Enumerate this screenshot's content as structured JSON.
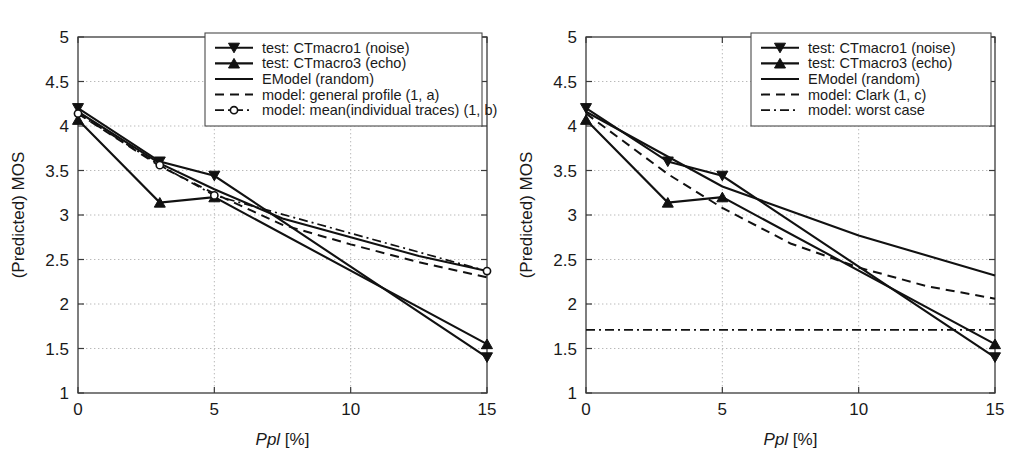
{
  "figure": {
    "panels": [
      {
        "id": "panel-a",
        "subcaption": "(a)",
        "xlabel_italic": "Ppl",
        "xlabel_rest": " [%]",
        "ylabel": "(Predicted) MOS"
      },
      {
        "id": "panel-b",
        "subcaption": "(b)",
        "xlabel_italic": "Ppl",
        "xlabel_rest": " [%]",
        "ylabel": "(Predicted) MOS"
      }
    ]
  },
  "axis": {
    "x_ticks": [
      "0",
      "5",
      "10",
      "15"
    ],
    "x_tick_values": [
      0,
      5,
      10,
      15
    ],
    "y_ticks": [
      "1",
      "1.5",
      "2",
      "2.5",
      "3",
      "3.5",
      "4",
      "4.5",
      "5"
    ],
    "y_tick_values": [
      1,
      1.5,
      2,
      2.5,
      3,
      3.5,
      4,
      4.5,
      5
    ],
    "xlim": [
      0,
      15
    ],
    "ylim": [
      1,
      5
    ],
    "grid": true,
    "grid_style": "dotted"
  },
  "colors": {
    "line": "#111111",
    "axis": "#3a3a3a",
    "grid": "#b9b9b9",
    "background": "#ffffff"
  },
  "legend_a": {
    "position": "top-center-right",
    "entries": [
      {
        "label": "test: CTmacro1 (noise)",
        "style": "solid",
        "marker": "triangle-down"
      },
      {
        "label": "test: CTmacro3 (echo)",
        "style": "solid",
        "marker": "triangle-up"
      },
      {
        "label": "EModel (random)",
        "style": "solid",
        "marker": "none"
      },
      {
        "label": "model: general profile (1, a)",
        "style": "dashed",
        "marker": "none"
      },
      {
        "label": "model: mean(individual traces) (1, b)",
        "style": "dashdot",
        "marker": "circle-open"
      }
    ]
  },
  "legend_b": {
    "position": "top-right",
    "entries": [
      {
        "label": "test: CTmacro1 (noise)",
        "style": "solid",
        "marker": "triangle-down"
      },
      {
        "label": "test: CTmacro3 (echo)",
        "style": "solid",
        "marker": "triangle-up"
      },
      {
        "label": "EModel (random)",
        "style": "solid",
        "marker": "none"
      },
      {
        "label": "model: Clark (1, c)",
        "style": "dashed",
        "marker": "none"
      },
      {
        "label": "model: worst case",
        "style": "dashdot",
        "marker": "none"
      }
    ]
  },
  "chart_data": [
    {
      "type": "line",
      "title": "(a)",
      "xlabel": "Ppl [%]",
      "ylabel": "(Predicted) MOS",
      "xlim": [
        0,
        15
      ],
      "ylim": [
        1,
        5
      ],
      "grid": true,
      "legend_position": "top-center",
      "series": [
        {
          "name": "test: CTmacro1 (noise)",
          "style": "solid",
          "marker": "triangle-down",
          "x": [
            0,
            3,
            5,
            15
          ],
          "values": [
            4.2,
            3.6,
            3.44,
            1.4
          ]
        },
        {
          "name": "test: CTmacro3 (echo)",
          "style": "solid",
          "marker": "triangle-up",
          "x": [
            0,
            3,
            5,
            15
          ],
          "values": [
            4.07,
            3.14,
            3.2,
            1.55
          ]
        },
        {
          "name": "EModel (random)",
          "style": "solid",
          "marker": "none",
          "x": [
            0,
            3,
            5,
            7.5,
            10,
            12.5,
            15
          ],
          "values": [
            4.16,
            3.58,
            3.29,
            2.96,
            2.75,
            2.54,
            2.37
          ]
        },
        {
          "name": "model: general profile (1, a)",
          "style": "dashed",
          "marker": "none",
          "x": [
            0,
            3,
            5,
            7.5,
            10,
            12.5,
            15
          ],
          "values": [
            4.14,
            3.55,
            3.24,
            2.89,
            2.67,
            2.47,
            2.3
          ]
        },
        {
          "name": "model: mean(individual traces) (1, b)",
          "style": "dashdot",
          "marker": "circle-open",
          "x": [
            0,
            3,
            5,
            15
          ],
          "values": [
            4.14,
            3.56,
            3.22,
            2.37
          ]
        }
      ]
    },
    {
      "type": "line",
      "title": "(b)",
      "xlabel": "Ppl [%]",
      "ylabel": "(Predicted) MOS",
      "xlim": [
        0,
        15
      ],
      "ylim": [
        1,
        5
      ],
      "grid": true,
      "legend_position": "top-right",
      "series": [
        {
          "name": "test: CTmacro1 (noise)",
          "style": "solid",
          "marker": "triangle-down",
          "x": [
            0,
            3,
            5,
            15
          ],
          "values": [
            4.2,
            3.6,
            3.44,
            1.4
          ]
        },
        {
          "name": "test: CTmacro3 (echo)",
          "style": "solid",
          "marker": "triangle-up",
          "x": [
            0,
            3,
            5,
            15
          ],
          "values": [
            4.07,
            3.14,
            3.2,
            1.55
          ]
        },
        {
          "name": "EModel (random)",
          "style": "solid",
          "marker": "none",
          "x": [
            0,
            5,
            10,
            15
          ],
          "values": [
            4.16,
            3.32,
            2.77,
            2.32
          ]
        },
        {
          "name": "model: Clark (1, c)",
          "style": "dashed",
          "marker": "none",
          "x": [
            0,
            3,
            5,
            7.5,
            10,
            12.5,
            15
          ],
          "values": [
            4.14,
            3.46,
            3.08,
            2.68,
            2.41,
            2.2,
            2.06
          ]
        },
        {
          "name": "model: worst case",
          "style": "dashdot",
          "marker": "none",
          "x": [
            0,
            15
          ],
          "values": [
            1.71,
            1.71
          ]
        }
      ]
    }
  ]
}
